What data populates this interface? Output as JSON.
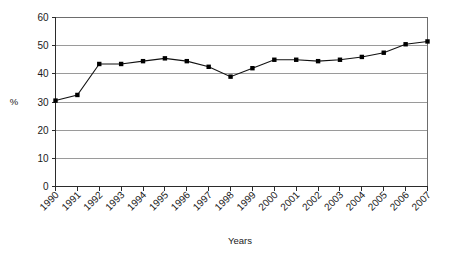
{
  "chart_data": {
    "type": "line",
    "title": "",
    "xlabel": "Years",
    "ylabel": "%",
    "categories": [
      "1990",
      "1991",
      "1992",
      "1993",
      "1994",
      "1995",
      "1996",
      "1997",
      "1998",
      "1999",
      "2000",
      "2001",
      "2002",
      "2003",
      "2004",
      "2005",
      "2006",
      "2007"
    ],
    "values": [
      30.5,
      32.5,
      43.5,
      43.5,
      44.5,
      45.5,
      44.5,
      42.5,
      39.0,
      42.0,
      45.0,
      45.0,
      44.5,
      45.0,
      46.0,
      47.5,
      50.5,
      51.5
    ],
    "series": [
      {
        "name": "",
        "values": [
          30.5,
          32.5,
          43.5,
          43.5,
          44.5,
          45.5,
          44.5,
          42.5,
          39.0,
          42.0,
          45.0,
          45.0,
          44.5,
          45.0,
          46.0,
          47.5,
          50.5,
          51.5
        ]
      }
    ],
    "ylim": [
      0,
      60
    ],
    "yticks": [
      0,
      10,
      20,
      30,
      40,
      50,
      60
    ],
    "ytick_labels": [
      "0",
      "10",
      "20",
      "30",
      "40",
      "50",
      "60"
    ],
    "grid": "horizontal",
    "legend": "none",
    "marker": "square",
    "line_color": "#111111",
    "marker_color": "#000000",
    "grid_color": "#9a9a9a",
    "frame_color": "#6d6d6d"
  }
}
